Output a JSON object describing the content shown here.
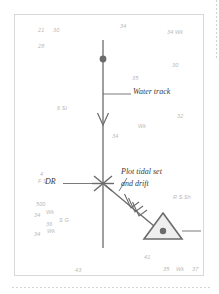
{
  "page": {
    "background_color": "#ffffff",
    "card_border_color": "#d8d8d8",
    "ink_color": "#5a5a5a",
    "sounding_color": "#b9b9b9",
    "label_color": "#3a3a3a"
  },
  "top_strip": {
    "text": ""
  },
  "diagram": {
    "labels": [
      {
        "id": "water-track",
        "text": "Water track"
      },
      {
        "id": "tidal-note-line1",
        "text": "Plot tidal set"
      },
      {
        "id": "tidal-note-line2",
        "text": "and drift"
      },
      {
        "id": "dr",
        "text": "DR"
      },
      {
        "id": "ep",
        "text": "EP"
      }
    ],
    "marks": [
      {
        "id": "fix",
        "type": "fix-dot"
      },
      {
        "id": "dr-mark",
        "type": "dr-cross"
      },
      {
        "id": "ep-mark",
        "type": "ep-triangle"
      },
      {
        "id": "track-arrow",
        "type": "direction-arrowhead"
      },
      {
        "id": "tidal-arrow",
        "type": "feathered-arrow"
      }
    ]
  },
  "soundings": [
    {
      "id": "s-21",
      "text": "21",
      "x": 23,
      "y": 12
    },
    {
      "id": "s-30-top",
      "text": "30",
      "x": 38,
      "y": 12
    },
    {
      "id": "s-34-top",
      "text": "34",
      "x": 105,
      "y": 8
    },
    {
      "id": "s-34wk-tr",
      "text": "34  Wk",
      "x": 152,
      "y": 14
    },
    {
      "id": "s-28",
      "text": "28",
      "x": 23,
      "y": 28
    },
    {
      "id": "s-30-right",
      "text": "30",
      "x": 157,
      "y": 47
    },
    {
      "id": "s-35",
      "text": "35",
      "x": 117,
      "y": 60
    },
    {
      "id": "s-6st",
      "text": "6 St",
      "x": 42,
      "y": 90
    },
    {
      "id": "s-32",
      "text": "32",
      "x": 162,
      "y": 98
    },
    {
      "id": "s-wk-mid",
      "text": "Wk",
      "x": 123,
      "y": 108
    },
    {
      "id": "s-34-mid",
      "text": "34",
      "x": 97,
      "y": 118
    },
    {
      "id": "s-4",
      "text": "4",
      "x": 25,
      "y": 156
    },
    {
      "id": "s-fs",
      "text": "F S",
      "x": 23,
      "y": 163
    },
    {
      "id": "s-rssh",
      "text": "R S Sh",
      "x": 158,
      "y": 179
    },
    {
      "id": "s-500",
      "text": "500",
      "x": 21,
      "y": 186
    },
    {
      "id": "s-34wk-bl",
      "text": "34",
      "x": 19,
      "y": 197
    },
    {
      "id": "s-wk-bl",
      "text": "Wk",
      "x": 31,
      "y": 194
    },
    {
      "id": "s-36",
      "text": "36",
      "x": 31,
      "y": 206
    },
    {
      "id": "s-sg",
      "text": "S G",
      "x": 44,
      "y": 202
    },
    {
      "id": "s-34-bl",
      "text": "34",
      "x": 19,
      "y": 216
    },
    {
      "id": "s-wk-bl2",
      "text": "Wk",
      "x": 32,
      "y": 213
    },
    {
      "id": "s-41",
      "text": "41",
      "x": 129,
      "y": 239
    },
    {
      "id": "s-43",
      "text": "43",
      "x": 60,
      "y": 252
    },
    {
      "id": "s-35-bot",
      "text": "35",
      "x": 148,
      "y": 251
    },
    {
      "id": "s-wk-bot",
      "text": "Wk",
      "x": 161,
      "y": 251
    },
    {
      "id": "s-37-bot",
      "text": "37",
      "x": 177,
      "y": 251
    }
  ]
}
